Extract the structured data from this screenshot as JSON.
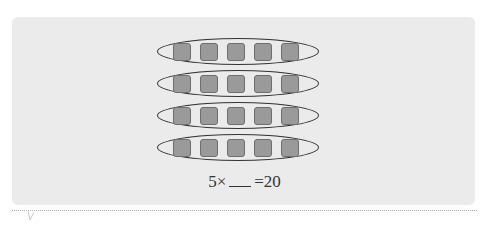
{
  "figure": {
    "rows": 4,
    "items_per_row": 5,
    "item_shape": "rounded-square",
    "group_shape": "ellipse",
    "colors": {
      "panel": "#ebebeb",
      "item_fill": "#9a9a9a",
      "item_border": "#6e6e6e",
      "ellipse": "#333333"
    }
  },
  "equation": {
    "left": "5×",
    "blank": "",
    "right": "=20"
  }
}
